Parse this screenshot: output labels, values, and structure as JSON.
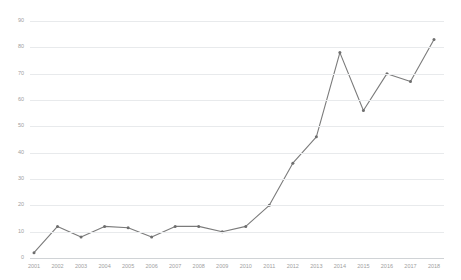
{
  "chart_data": {
    "type": "line",
    "title": "",
    "xlabel": "",
    "ylabel": "",
    "categories": [
      "2001",
      "2002",
      "2003",
      "2004",
      "2005",
      "2006",
      "2007",
      "2008",
      "2009",
      "2010",
      "2011",
      "2012",
      "2013",
      "2014",
      "2015",
      "2016",
      "2017",
      "2018"
    ],
    "values": [
      2,
      12,
      8,
      12,
      11.5,
      8,
      12,
      12,
      10,
      12,
      20,
      36,
      46,
      78,
      56,
      70,
      67,
      83
    ],
    "series": [
      {
        "name": "",
        "values": [
          2,
          12,
          8,
          12,
          11.5,
          8,
          12,
          12,
          10,
          12,
          20,
          36,
          46,
          78,
          56,
          70,
          67,
          83
        ]
      }
    ],
    "ylim": [
      0,
      90
    ],
    "yticks": [
      0,
      10,
      20,
      30,
      40,
      50,
      60,
      70,
      80,
      90
    ],
    "ytick_labels": [
      "0",
      "10",
      "20",
      "30",
      "40",
      "50",
      "60",
      "70",
      "80",
      "90"
    ],
    "xtick_labels": [
      "2001",
      "2002",
      "2003",
      "2004",
      "2005",
      "2006",
      "2007",
      "2008",
      "2009",
      "2010",
      "2011",
      "2012",
      "2013",
      "2014",
      "2015",
      "2016",
      "2017",
      "2018"
    ],
    "grid": true,
    "legend": false,
    "legend_position": "none",
    "markers": true,
    "colors": {
      "line": "#7b7b7b",
      "marker": "#6e6e6e",
      "grid": "#e8eaec",
      "axis": "#d0d3d6",
      "tick_text": "#a0a0a0",
      "background": "#ffffff"
    }
  }
}
